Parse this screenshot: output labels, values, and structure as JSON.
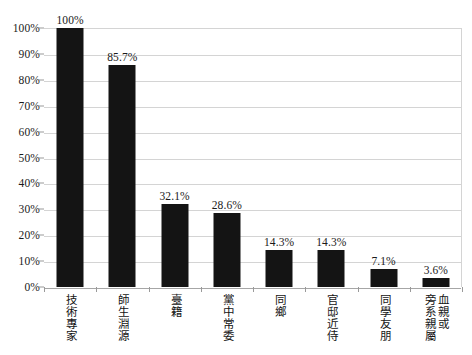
{
  "chart_data": {
    "type": "bar",
    "title": "",
    "subtitle": "",
    "xlabel": "",
    "ylabel": "",
    "categories": [
      "技術專家",
      "師生淵源",
      "臺籍",
      "黨中常委",
      "同鄉",
      "官邸近侍",
      "同學友朋",
      "血親或旁系親屬"
    ],
    "category_columns": [
      [
        "技術專家"
      ],
      [
        "師生淵源"
      ],
      [
        "臺籍"
      ],
      [
        "黨中常委"
      ],
      [
        "同鄉"
      ],
      [
        "官邸近侍"
      ],
      [
        "同學友朋"
      ],
      [
        "血親或",
        "旁系親屬"
      ]
    ],
    "values": [
      100,
      85.7,
      32.1,
      28.6,
      14.3,
      14.3,
      7.1,
      3.6
    ],
    "value_labels": [
      "100%",
      "85.7%",
      "32.1%",
      "28.6%",
      "14.3%",
      "14.3%",
      "7.1%",
      "3.6%"
    ],
    "ylim": [
      0,
      100
    ],
    "ytick_values": [
      0,
      10,
      20,
      30,
      40,
      50,
      60,
      70,
      80,
      90,
      100
    ],
    "ytick_labels": [
      "0%",
      "10%",
      "20%",
      "30%",
      "40%",
      "50%",
      "60%",
      "70%",
      "80%",
      "90%",
      "100%"
    ],
    "grid": true,
    "legend": false,
    "legend_position": "none",
    "bar_color": "#141414",
    "gridline_color": "#d4d4d4",
    "axis_color": "#9a9a9a",
    "background_color": "#ffffff",
    "text_color": "#1a1a1a"
  }
}
